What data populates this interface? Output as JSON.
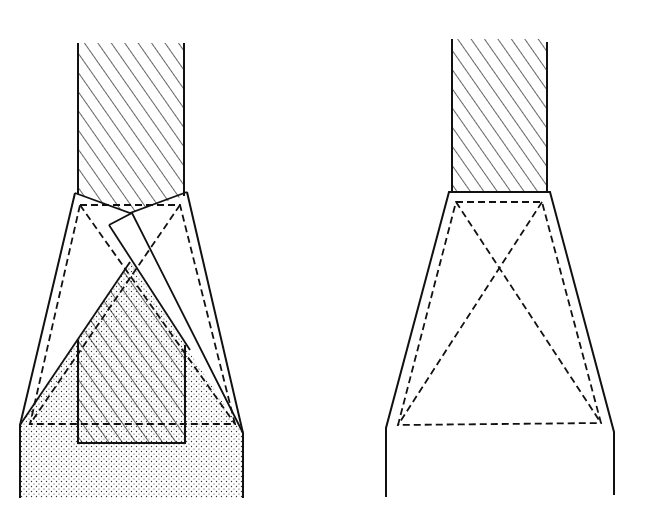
{
  "figure": {
    "width": 647,
    "height": 522,
    "background": "#ffffff",
    "stroke_color": "#111111",
    "panels": [
      {
        "id": "left",
        "description": "Tapered socket with inserted bar rotated/slipped; bar wedged in lower stippled base",
        "upper_column": {
          "x1": 78,
          "x2": 184,
          "y_top": 43
        },
        "hatch": "diagonal",
        "fill_lower": "stipple"
      },
      {
        "id": "right",
        "description": "Tapered socket with bar seated on top; dashed truss inside",
        "upper_column": {
          "x1": 452,
          "x2": 547,
          "y_top": 39
        },
        "hatch": "diagonal"
      }
    ]
  }
}
